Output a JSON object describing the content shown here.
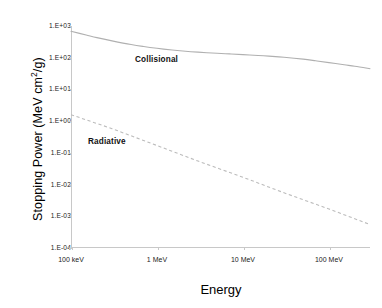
{
  "chart_data": {
    "type": "line",
    "title": "",
    "xlabel": "Energy",
    "ylabel": "Stopping Power (MeV cm2/g)",
    "ylabel_prefix": "Stopping Power (MeV cm",
    "ylabel_superscript": "2",
    "ylabel_suffix": "/g)",
    "xscale": "log",
    "yscale": "log",
    "xlim": [
      0.1,
      300
    ],
    "ylim": [
      0.0001,
      1000
    ],
    "grid": false,
    "legend_position": "inline-annotations",
    "x_ticks": [
      {
        "value": 0.1,
        "label": "100 keV"
      },
      {
        "value": 1,
        "label": "1 MeV"
      },
      {
        "value": 10,
        "label": "10 MeV"
      },
      {
        "value": 100,
        "label": "100 MeV"
      }
    ],
    "y_ticks": [
      {
        "value": 1000,
        "label": "1.E+03"
      },
      {
        "value": 100,
        "label": "1.E+02"
      },
      {
        "value": 10,
        "label": "1.E+01"
      },
      {
        "value": 1,
        "label": "1.E+00"
      },
      {
        "value": 0.1,
        "label": "1.E-01"
      },
      {
        "value": 0.01,
        "label": "1.E-02"
      },
      {
        "value": 0.001,
        "label": "1.E-03"
      },
      {
        "value": 0.0001,
        "label": "1.E-04"
      }
    ],
    "series": [
      {
        "name": "Collisional",
        "style": "solid",
        "color": "#b0b0b0",
        "annotation": "Collisional",
        "x": [
          0.1,
          0.15,
          0.2,
          0.3,
          0.5,
          0.7,
          1,
          1.5,
          2,
          3,
          5,
          7,
          10,
          15,
          20,
          30,
          50,
          70,
          100,
          150,
          200,
          300
        ],
        "y": [
          680,
          520,
          430,
          340,
          260,
          225,
          198,
          175,
          163,
          150,
          138,
          132,
          125,
          118,
          112,
          103,
          90,
          80,
          70,
          60,
          54,
          45
        ]
      },
      {
        "name": "Radiative",
        "style": "dashed",
        "color": "#b8b8b8",
        "annotation": "Radiative",
        "x": [
          0.1,
          0.3,
          1,
          3,
          10,
          30,
          100,
          300
        ],
        "y": [
          1.6,
          0.58,
          0.17,
          0.055,
          0.017,
          0.0055,
          0.0017,
          0.00055
        ]
      }
    ]
  }
}
